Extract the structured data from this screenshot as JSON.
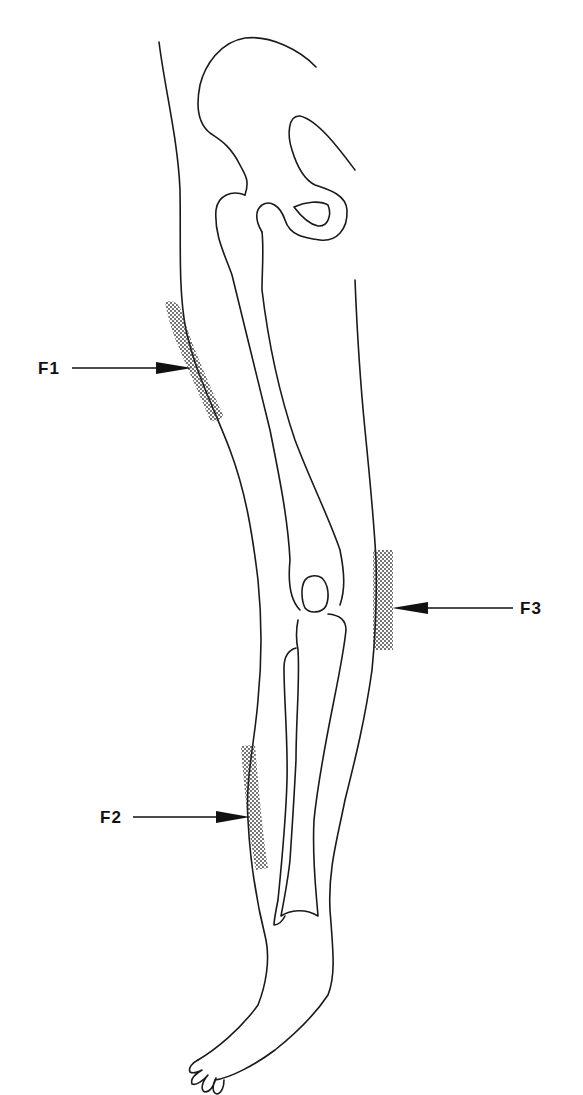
{
  "figure": {
    "type": "anatomical-leg-diagram",
    "line_color": "#1a1a1a",
    "shade_color": "#333333",
    "background": "#ffffff"
  },
  "markers": [
    {
      "id": "F1",
      "label": "F1",
      "region": "lateral thigh",
      "arrow_direction": "right"
    },
    {
      "id": "F2",
      "label": "F2",
      "region": "lateral lower leg",
      "arrow_direction": "right"
    },
    {
      "id": "F3",
      "label": "F3",
      "region": "medial knee",
      "arrow_direction": "left"
    }
  ]
}
